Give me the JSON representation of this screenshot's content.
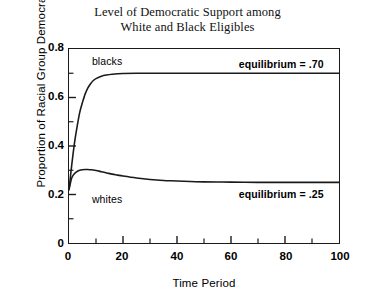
{
  "chart_data": {
    "type": "line",
    "title": "Level of Democratic Support among White and Black Eligibles",
    "title_lines": [
      "Level of Democratic Support among",
      "White and Black Eligibles"
    ],
    "xlabel": "Time Period",
    "ylabel": "Proportion of Racial Group Democratic",
    "xlim": [
      0,
      100
    ],
    "ylim": [
      0,
      0.8
    ],
    "grid": false,
    "legend_position": "inline-annotations",
    "x_ticks": [
      0,
      20,
      40,
      60,
      80,
      100
    ],
    "x_tick_labels": [
      "0",
      "20",
      "40",
      "60",
      "80",
      "100"
    ],
    "x_minor_tick_interval": 10,
    "y_ticks": [
      0,
      0.2,
      0.4,
      0.6,
      0.8
    ],
    "y_tick_labels": [
      "0",
      "0.2",
      "0.4",
      "0.6",
      "0.8"
    ],
    "y_minor_tick_interval": 0.1,
    "series": [
      {
        "name": "blacks",
        "color": "#1a1a1a",
        "equilibrium": 0.7,
        "x": [
          0,
          1,
          2,
          3,
          4,
          5,
          6,
          7,
          8,
          9,
          10,
          12,
          14,
          16,
          18,
          20,
          25,
          30,
          40,
          50,
          60,
          70,
          80,
          90,
          100
        ],
        "values": [
          0.22,
          0.32,
          0.41,
          0.48,
          0.54,
          0.58,
          0.615,
          0.64,
          0.657,
          0.67,
          0.678,
          0.688,
          0.693,
          0.696,
          0.698,
          0.699,
          0.7,
          0.7,
          0.7,
          0.7,
          0.7,
          0.7,
          0.7,
          0.7,
          0.7
        ]
      },
      {
        "name": "whites",
        "color": "#1a1a1a",
        "equilibrium": 0.25,
        "x": [
          0,
          1,
          2,
          3,
          4,
          5,
          6,
          7,
          8,
          9,
          10,
          12,
          14,
          16,
          18,
          20,
          25,
          30,
          35,
          40,
          50,
          60,
          70,
          80,
          90,
          100
        ],
        "values": [
          0.22,
          0.268,
          0.286,
          0.295,
          0.3,
          0.302,
          0.303,
          0.303,
          0.302,
          0.301,
          0.299,
          0.294,
          0.289,
          0.284,
          0.28,
          0.276,
          0.268,
          0.262,
          0.258,
          0.256,
          0.252,
          0.251,
          0.25,
          0.25,
          0.25,
          0.25
        ]
      }
    ],
    "annotations": [
      {
        "text": "blacks",
        "x": 14,
        "y": 0.745
      },
      {
        "text": "whites",
        "x": 14,
        "y": 0.185
      },
      {
        "text": "equilibrium = .70",
        "x": 78,
        "y": 0.735
      },
      {
        "text": "equilibrium = .25",
        "x": 78,
        "y": 0.205
      }
    ]
  }
}
